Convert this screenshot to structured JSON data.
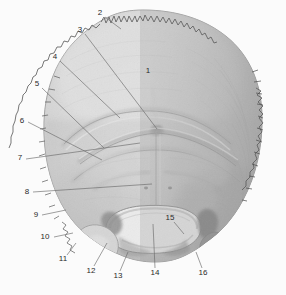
{
  "figure": {
    "view": "external-posterior",
    "style": "grayscale-anatomical-engraving",
    "width": 286,
    "height": 295,
    "background_color": "#fbfbfb",
    "bone_light_color": "#e9e9e9",
    "bone_mid_color": "#c9c9c9",
    "bone_dark_color": "#8e8e8e",
    "outline_color": "#6a6a6a",
    "leader_color": "#6b6b6b",
    "label_color": "#2a2a2a",
    "foramen_color": "#fdfdfd"
  },
  "labels": [
    {
      "id": "1",
      "text": "1",
      "x": 148,
      "y": 71,
      "leader": null
    },
    {
      "id": "2",
      "text": "2",
      "x": 100,
      "y": 13,
      "leader": {
        "x1": 105,
        "y1": 17,
        "x2": 121,
        "y2": 29
      }
    },
    {
      "id": "3",
      "text": "3",
      "x": 80,
      "y": 30,
      "leader": {
        "x1": 85,
        "y1": 34,
        "x2": 157,
        "y2": 129
      }
    },
    {
      "id": "4",
      "text": "4",
      "x": 55,
      "y": 57,
      "leader": {
        "x1": 60,
        "y1": 61,
        "x2": 120,
        "y2": 118
      }
    },
    {
      "id": "5",
      "text": "5",
      "x": 37,
      "y": 84,
      "leader": {
        "x1": 42,
        "y1": 88,
        "x2": 104,
        "y2": 148
      }
    },
    {
      "id": "6",
      "text": "6",
      "x": 22,
      "y": 121,
      "leader": {
        "x1": 28,
        "y1": 122,
        "x2": 102,
        "y2": 160
      }
    },
    {
      "id": "7",
      "text": "7",
      "x": 20,
      "y": 158,
      "leader": {
        "x1": 26,
        "y1": 159,
        "x2": 140,
        "y2": 143
      }
    },
    {
      "id": "8",
      "text": "8",
      "x": 27,
      "y": 192,
      "leader": {
        "x1": 33,
        "y1": 192,
        "x2": 152,
        "y2": 184
      }
    },
    {
      "id": "9",
      "text": "9",
      "x": 36,
      "y": 215,
      "leader": {
        "x1": 42,
        "y1": 215,
        "x2": 66,
        "y2": 210
      }
    },
    {
      "id": "10",
      "text": "10",
      "x": 45,
      "y": 237,
      "leader": {
        "x1": 54,
        "y1": 237,
        "x2": 73,
        "y2": 233
      }
    },
    {
      "id": "11",
      "text": "11",
      "x": 63,
      "y": 259,
      "leader": {
        "x1": 67,
        "y1": 255,
        "x2": 76,
        "y2": 243
      }
    },
    {
      "id": "12",
      "text": "12",
      "x": 91,
      "y": 271,
      "leader": {
        "x1": 94,
        "y1": 266,
        "x2": 107,
        "y2": 243
      }
    },
    {
      "id": "13",
      "text": "13",
      "x": 118,
      "y": 276,
      "leader": {
        "x1": 120,
        "y1": 271,
        "x2": 128,
        "y2": 252
      }
    },
    {
      "id": "14",
      "text": "14",
      "x": 155,
      "y": 273,
      "leader": {
        "x1": 155,
        "y1": 268,
        "x2": 153,
        "y2": 224
      }
    },
    {
      "id": "15",
      "text": "15",
      "x": 170,
      "y": 218,
      "leader": {
        "x1": 174,
        "y1": 222,
        "x2": 184,
        "y2": 234
      }
    },
    {
      "id": "16",
      "text": "16",
      "x": 203,
      "y": 273,
      "leader": {
        "x1": 202,
        "y1": 268,
        "x2": 196,
        "y2": 252
      }
    }
  ]
}
